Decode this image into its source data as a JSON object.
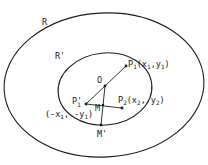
{
  "diagram": {
    "regions": [
      {
        "name": "R",
        "label": "R",
        "cx": 104,
        "cy": 85,
        "rx": 100,
        "ry": 73
      },
      {
        "name": "R'",
        "label": "R'",
        "cx": 105,
        "cy": 89,
        "rx": 47,
        "ry": 36
      }
    ],
    "points": {
      "O": {
        "label": "O",
        "x": 105,
        "y": 86
      },
      "P1": {
        "label": "P",
        "sub": "1",
        "coords": "(x",
        "coords_sub1": "1",
        "coords_mid": ",y",
        "coords_sub2": "1",
        "coords_end": ")",
        "x": 126,
        "y": 66
      },
      "P1prime": {
        "label": "P'",
        "sub": "1",
        "coords": "(-x",
        "coords_sub1": "1",
        "coords_mid": ", -y",
        "coords_sub2": "1",
        "coords_end": ")",
        "x": 86,
        "y": 104
      },
      "P2": {
        "label": "P",
        "sub": "2",
        "coords": "(x",
        "coords_sub1": "2",
        "coords_mid": ", y",
        "coords_sub2": "2",
        "coords_end": ")",
        "x": 122,
        "y": 108
      },
      "M": {
        "label": "M",
        "x": 103,
        "y": 105
      },
      "Mprime": {
        "label": "M'",
        "x": 101,
        "y": 125
      }
    },
    "stroke_color": "#1a1a1a",
    "background": "#ffffff"
  }
}
